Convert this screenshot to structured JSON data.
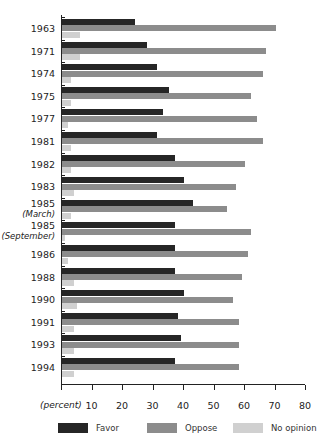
{
  "chart_data": {
    "type": "bar",
    "orientation": "horizontal",
    "title": "",
    "xlabel": "(percent)",
    "ylabel": "",
    "xlim": [
      0,
      80
    ],
    "xticks": [
      10,
      20,
      30,
      40,
      50,
      60,
      70,
      80
    ],
    "grid": false,
    "legend_position": "bottom",
    "categories": [
      "1963",
      "1971",
      "1974",
      "1975",
      "1977",
      "1981",
      "1982",
      "1983",
      "1985 (March)",
      "1985 (September)",
      "1986",
      "1988",
      "1990",
      "1991",
      "1993",
      "1994"
    ],
    "category_labels": [
      {
        "main": "1963",
        "sub": ""
      },
      {
        "main": "1971",
        "sub": ""
      },
      {
        "main": "1974",
        "sub": ""
      },
      {
        "main": "1975",
        "sub": ""
      },
      {
        "main": "1977",
        "sub": ""
      },
      {
        "main": "1981",
        "sub": ""
      },
      {
        "main": "1982",
        "sub": ""
      },
      {
        "main": "1983",
        "sub": ""
      },
      {
        "main": "1985",
        "sub": "(March)"
      },
      {
        "main": "1985",
        "sub": "(September)"
      },
      {
        "main": "1986",
        "sub": ""
      },
      {
        "main": "1988",
        "sub": ""
      },
      {
        "main": "1990",
        "sub": ""
      },
      {
        "main": "1991",
        "sub": ""
      },
      {
        "main": "1993",
        "sub": ""
      },
      {
        "main": "1994",
        "sub": ""
      }
    ],
    "series": [
      {
        "name": "Favor",
        "color": "#262626",
        "values": [
          24,
          28,
          31,
          35,
          33,
          31,
          37,
          40,
          43,
          37,
          37,
          37,
          40,
          38,
          39,
          37
        ]
      },
      {
        "name": "Oppose",
        "color": "#8c8c8c",
        "values": [
          70,
          67,
          66,
          62,
          64,
          66,
          60,
          57,
          54,
          62,
          61,
          59,
          56,
          58,
          58,
          58
        ]
      },
      {
        "name": "No opinion",
        "color": "#d0d0d0",
        "values": [
          6,
          6,
          3,
          3,
          2,
          3,
          3,
          4,
          3,
          1,
          2,
          4,
          5,
          4,
          4,
          4
        ]
      }
    ]
  }
}
